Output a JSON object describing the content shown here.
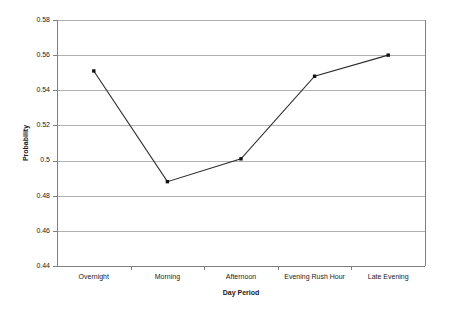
{
  "chart_data": {
    "type": "line",
    "title": "",
    "xlabel": "Day Period",
    "ylabel": "Probability",
    "categories": [
      "Overnight",
      "Morning",
      "Afternoon",
      "Evening Rush Hour",
      "Late Evening"
    ],
    "values": [
      0.551,
      0.488,
      0.501,
      0.548,
      0.56
    ],
    "series": [
      {
        "name": "Probability",
        "values": [
          0.551,
          0.488,
          0.501,
          0.548,
          0.56
        ]
      }
    ],
    "ylim": [
      0.44,
      0.58
    ],
    "ytick_step": 0.02,
    "ytick_labels": [
      "0.58",
      "0.56",
      "0.54",
      "0.52",
      "0.5",
      "0.48",
      "0.46",
      "0.44"
    ],
    "ytick_values": [
      0.58,
      0.56,
      0.54,
      0.52,
      0.5,
      0.48,
      0.46,
      0.44
    ],
    "grid": "horizontal",
    "legend": "none",
    "marker": "square",
    "line_color": "#2b2b2b",
    "marker_color": "#111111",
    "gridline_color": "#b0b0b0",
    "axis_color": "#808080",
    "background_color": "#ffffff"
  }
}
